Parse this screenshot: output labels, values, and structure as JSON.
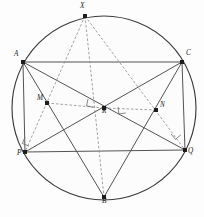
{
  "figure": {
    "canvas": {
      "width": 204,
      "height": 217,
      "background": "#fdfdfd"
    },
    "circle": {
      "name": "circumcircle",
      "center_x": 104,
      "center_y": 108,
      "radius": 92,
      "stroke": "#3a3a3a",
      "fill": "#fcfcfc"
    },
    "colors": {
      "solid_chord": "#4a4a4a",
      "dashed_chord": "#8a8a8a",
      "vertex": "#1d1d1d",
      "label": "#1a1a1a",
      "right_angle": "#6b6b6b"
    },
    "points": [
      {
        "id": "X",
        "label": "X",
        "x": 85,
        "y": 16,
        "label_dx": -5,
        "label_dy": -9,
        "on_circle": true
      },
      {
        "id": "A",
        "label": "A",
        "x": 23,
        "y": 62,
        "label_dx": -9,
        "label_dy": -7,
        "on_circle": true
      },
      {
        "id": "C",
        "label": "C",
        "x": 182,
        "y": 62,
        "label_dx": 4,
        "label_dy": -8,
        "on_circle": true
      },
      {
        "id": "M",
        "label": "M",
        "x": 47,
        "y": 103,
        "label_dx": -10,
        "label_dy": -4,
        "on_circle": false
      },
      {
        "id": "R",
        "label": "R",
        "x": 104,
        "y": 108,
        "label_dx": -2,
        "label_dy": 4,
        "on_circle": false
      },
      {
        "id": "N",
        "label": "N",
        "x": 156,
        "y": 110,
        "label_dx": 4,
        "label_dy": -4,
        "on_circle": false
      },
      {
        "id": "P",
        "label": "P",
        "x": 25,
        "y": 152,
        "label_dx": -8,
        "label_dy": 2,
        "on_circle": true
      },
      {
        "id": "Q",
        "label": "Q",
        "x": 185,
        "y": 150,
        "label_dx": 3,
        "label_dy": 2,
        "on_circle": true
      },
      {
        "id": "B",
        "label": "B",
        "x": 104,
        "y": 197,
        "label_dx": -2,
        "label_dy": 5,
        "on_circle": true
      }
    ],
    "solid_segments": [
      {
        "name": "segment-A-C",
        "from": "A",
        "to": "C"
      },
      {
        "name": "segment-A-B",
        "from": "A",
        "to": "B"
      },
      {
        "name": "segment-A-Q",
        "from": "A",
        "to": "Q"
      },
      {
        "name": "segment-A-P",
        "from": "A",
        "to": "P"
      },
      {
        "name": "segment-C-B",
        "from": "C",
        "to": "B"
      },
      {
        "name": "segment-C-P",
        "from": "C",
        "to": "P"
      },
      {
        "name": "segment-C-Q",
        "from": "C",
        "to": "Q"
      },
      {
        "name": "segment-P-Q",
        "from": "P",
        "to": "Q"
      }
    ],
    "dashed_segments": [
      {
        "name": "segment-X-P",
        "from": "X",
        "to": "P"
      },
      {
        "name": "segment-X-Q",
        "from": "X",
        "to": "Q"
      },
      {
        "name": "segment-X-B",
        "from": "X",
        "to": "B"
      },
      {
        "name": "segment-M-R",
        "from": "M",
        "to": "R"
      },
      {
        "name": "segment-R-N",
        "from": "R",
        "to": "N"
      }
    ],
    "right_angle_marks": [
      {
        "name": "right-angle-at-R-left",
        "x": 88,
        "y": 99,
        "rotation": 12
      },
      {
        "name": "right-angle-at-R-right",
        "x": 118,
        "y": 107,
        "rotation": -8
      },
      {
        "name": "right-angle-at-P",
        "x": 25,
        "y": 137,
        "rotation": 22
      },
      {
        "name": "right-angle-at-Q",
        "x": 171,
        "y": 134,
        "rotation": -40
      }
    ]
  }
}
